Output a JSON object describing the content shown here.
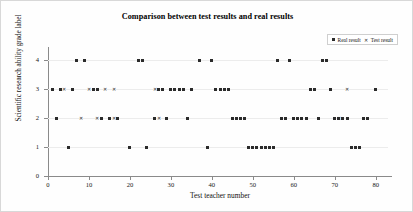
{
  "chart_data": {
    "type": "scatter",
    "title": "Comparison between test results and real results",
    "xlabel": "Test teacher number",
    "ylabel": "Scientific research ability grade label",
    "xlim": [
      0,
      83
    ],
    "ylim": [
      0,
      4.45
    ],
    "xticks": [
      0,
      10,
      20,
      30,
      40,
      50,
      60,
      70,
      80
    ],
    "yticks": [
      0,
      1,
      2,
      3,
      4
    ],
    "grid": true,
    "legend_position": "top-right",
    "marker_colors": {
      "real": "#2b2b2b",
      "test": "#2b2b2b"
    },
    "series": [
      {
        "name": "Real result",
        "marker": "square",
        "x": [
          1,
          2,
          3,
          5,
          6,
          7,
          9,
          11,
          12,
          13,
          15,
          17,
          20,
          22,
          23,
          24,
          26,
          27,
          28,
          29,
          30,
          31,
          32,
          33,
          34,
          35,
          37,
          39,
          40,
          41,
          42,
          43,
          44,
          45,
          46,
          47,
          48,
          49,
          50,
          51,
          52,
          53,
          54,
          55,
          56,
          57,
          58,
          59,
          60,
          61,
          62,
          63,
          64,
          65,
          66,
          67,
          68,
          69,
          70,
          71,
          72,
          73,
          74,
          75,
          76,
          77,
          78,
          80
        ],
        "y": [
          3,
          2,
          3,
          1,
          3,
          4,
          4,
          3,
          3,
          2,
          2,
          2,
          1,
          4,
          4,
          1,
          2,
          3,
          3,
          2,
          3,
          3,
          3,
          3,
          2,
          3,
          4,
          1,
          4,
          3,
          3,
          3,
          3,
          2,
          2,
          2,
          2,
          1,
          1,
          1,
          1,
          1,
          1,
          1,
          4,
          2,
          2,
          4,
          2,
          2,
          2,
          2,
          3,
          3,
          2,
          4,
          4,
          3,
          2,
          2,
          2,
          2,
          1,
          1,
          1,
          2,
          2,
          3
        ]
      },
      {
        "name": "Test result",
        "marker": "x",
        "x": [
          1,
          2,
          3,
          5,
          6,
          7,
          9,
          11,
          12,
          13,
          14,
          15,
          16,
          17,
          18,
          20,
          22,
          23,
          24,
          26,
          27,
          28,
          29,
          30,
          31,
          32,
          33,
          34,
          35,
          37,
          39,
          40,
          41,
          42,
          43,
          44,
          45,
          46,
          47,
          48,
          49,
          50,
          51,
          52,
          53,
          54,
          55,
          56,
          57,
          58,
          59,
          60,
          61,
          62,
          63,
          64,
          65,
          66,
          67,
          68,
          69,
          70,
          71,
          72,
          73,
          74,
          75,
          76,
          77,
          78,
          80
        ],
        "y": [
          3,
          2,
          3,
          1,
          3,
          4,
          4,
          3,
          3,
          2,
          2,
          2,
          2,
          2,
          2,
          1,
          4,
          4,
          1,
          2,
          3,
          3,
          2,
          3,
          3,
          3,
          3,
          2,
          3,
          4,
          1,
          4,
          3,
          3,
          3,
          3,
          2,
          2,
          2,
          2,
          1,
          1,
          1,
          1,
          1,
          1,
          1,
          4,
          2,
          2,
          4,
          2,
          2,
          2,
          2,
          3,
          3,
          2,
          4,
          4,
          3,
          2,
          2,
          2,
          2,
          1,
          1,
          1,
          2,
          2,
          3
        ]
      }
    ],
    "divergent_test_points": [
      {
        "x": 4,
        "y": 3
      },
      {
        "x": 10,
        "y": 3
      },
      {
        "x": 14,
        "y": 3
      },
      {
        "x": 16,
        "y": 3
      },
      {
        "x": 26,
        "y": 3
      },
      {
        "x": 73,
        "y": 3
      },
      {
        "x": 8,
        "y": 2
      },
      {
        "x": 12,
        "y": 2
      },
      {
        "x": 16,
        "y": 2
      },
      {
        "x": 27,
        "y": 2
      },
      {
        "x": 71,
        "y": 2
      }
    ]
  },
  "legend": {
    "real_label": "Real result",
    "test_label": "Test result",
    "real_icon": "square-marker-icon",
    "test_icon": "x-marker-icon"
  }
}
